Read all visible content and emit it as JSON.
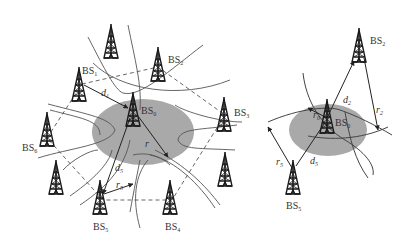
{
  "diagram": {
    "left": {
      "base_stations": [
        {
          "id": "BS0",
          "name": "BS",
          "sub": "0"
        },
        {
          "id": "BS1",
          "name": "BS",
          "sub": "1"
        },
        {
          "id": "BS2",
          "name": "BS",
          "sub": "2"
        },
        {
          "id": "BS3",
          "name": "BS",
          "sub": "3"
        },
        {
          "id": "BS4",
          "name": "BS",
          "sub": "4"
        },
        {
          "id": "BS5",
          "name": "BS",
          "sub": "5"
        },
        {
          "id": "BS6",
          "name": "BS",
          "sub": "6"
        }
      ],
      "distances": [
        {
          "name": "d",
          "sub": "1"
        },
        {
          "name": "d",
          "sub": "5"
        },
        {
          "name": "r",
          "sub": ""
        },
        {
          "name": "r",
          "sub": "5"
        }
      ]
    },
    "right": {
      "base_stations": [
        {
          "id": "BS0",
          "name": "BS",
          "sub": "0"
        },
        {
          "id": "BS2",
          "name": "BS",
          "sub": "2"
        },
        {
          "id": "BS5",
          "name": "BS",
          "sub": "5"
        }
      ],
      "distances": [
        {
          "name": "d",
          "sub": "2"
        },
        {
          "name": "d",
          "sub": "5"
        },
        {
          "name": "r",
          "sub": "0"
        },
        {
          "name": "r",
          "sub": "2"
        },
        {
          "name": "r",
          "sub": "5"
        }
      ]
    },
    "colors": {
      "ellipse_fill": "#a9a9a9",
      "line": "#444444",
      "tower": "#1a1a1a",
      "text": "#333333"
    }
  }
}
